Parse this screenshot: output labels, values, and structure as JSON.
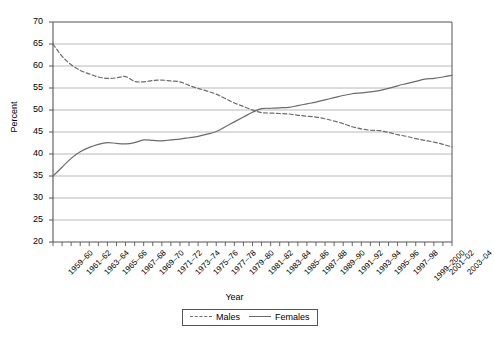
{
  "chart_data": {
    "type": "line",
    "title": "",
    "xlabel": "Year",
    "ylabel": "Percent",
    "ylim": [
      20,
      70
    ],
    "ytick_step": 5,
    "yticks": [
      70,
      65,
      60,
      55,
      50,
      45,
      40,
      35,
      30,
      25,
      20
    ],
    "grid": true,
    "grid_axis": "y",
    "legend_position": "bottom-center",
    "categories": [
      "1959–60",
      "1960–61",
      "1961–62",
      "1962–63",
      "1963–64",
      "1964–65",
      "1965–66",
      "1966–67",
      "1967–68",
      "1968–69",
      "1969–70",
      "1970–71",
      "1971–72",
      "1972–73",
      "1973–74",
      "1974–75",
      "1975–76",
      "1976–77",
      "1977–78",
      "1978–79",
      "1979–80",
      "1980–81",
      "1981–82",
      "1982–83",
      "1983–84",
      "1984–85",
      "1985–86",
      "1986–87",
      "1987–88",
      "1988–89",
      "1989–90",
      "1990–91",
      "1991–92",
      "1992–93",
      "1993–94",
      "1994–95",
      "1995–96",
      "1996–97",
      "1997–98",
      "1998–99",
      "1999–2000",
      "2000–01",
      "2001–02",
      "2002–03",
      "2003–04"
    ],
    "visible_tick_labels": [
      "1959–60",
      "1961–62",
      "1963–64",
      "1965–66",
      "1967–68",
      "1969–70",
      "1971–72",
      "1973–74",
      "1975–76",
      "1977–78",
      "1979–80",
      "1981–82",
      "1983–84",
      "1985–86",
      "1987–88",
      "1989–90",
      "1991–92",
      "1993–94",
      "1995–96",
      "1997–98",
      "1999–2000",
      "2001–02",
      "2003–04"
    ],
    "series": [
      {
        "name": "Males",
        "style": "dashed",
        "color": "#6b6b6b",
        "values": [
          65.0,
          62.2,
          60.3,
          59.0,
          58.2,
          57.5,
          57.2,
          57.3,
          57.6,
          56.5,
          56.4,
          56.7,
          56.8,
          56.6,
          56.4,
          55.6,
          54.9,
          54.3,
          53.6,
          52.6,
          51.6,
          50.8,
          50.0,
          49.4,
          49.3,
          49.2,
          49.1,
          48.8,
          48.6,
          48.4,
          48.0,
          47.5,
          46.9,
          46.2,
          45.7,
          45.4,
          45.3,
          44.9,
          44.4,
          44.0,
          43.5,
          43.1,
          42.7,
          42.2,
          41.6
        ]
      },
      {
        "name": "Females",
        "style": "solid",
        "color": "#6b6b6b",
        "values": [
          35.0,
          37.0,
          39.0,
          40.5,
          41.5,
          42.2,
          42.6,
          42.4,
          42.3,
          42.6,
          43.2,
          43.1,
          43.0,
          43.2,
          43.4,
          43.7,
          44.0,
          44.5,
          45.1,
          46.2,
          47.3,
          48.4,
          49.5,
          50.3,
          50.4,
          50.5,
          50.6,
          51.0,
          51.4,
          51.8,
          52.3,
          52.8,
          53.3,
          53.7,
          53.9,
          54.1,
          54.4,
          54.9,
          55.5,
          56.0,
          56.5,
          57.0,
          57.2,
          57.5,
          57.9
        ]
      }
    ]
  },
  "axes": {
    "y_title": "Percent",
    "x_title": "Year"
  },
  "legend": {
    "entries": [
      {
        "label": "Males",
        "style": "dashed"
      },
      {
        "label": "Females",
        "style": "solid"
      }
    ]
  },
  "colors": {
    "line": "#6b6b6b",
    "grid": "#b0b0b0",
    "axis": "#555555",
    "text": "#000000",
    "background": "#ffffff"
  }
}
